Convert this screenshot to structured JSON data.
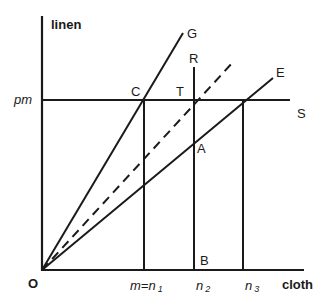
{
  "diagram": {
    "axes": {
      "y_label": "linen",
      "x_label": "cloth",
      "origin_label": "O",
      "price_level_label": "pm"
    },
    "rays": [
      {
        "id": "G",
        "label": "G",
        "style": "solid"
      },
      {
        "id": "dashed",
        "label": "",
        "style": "dashed"
      },
      {
        "id": "E",
        "label": "E",
        "style": "solid"
      }
    ],
    "points": {
      "C": "C",
      "T": "T",
      "A": "A",
      "B": "B",
      "R": "R",
      "S": "S"
    },
    "x_ticks": {
      "n1_prefix": "m=",
      "n1": "n",
      "n1_sub": "1",
      "n2": "n",
      "n2_sub": "2",
      "n3": "n",
      "n3_sub": "3"
    },
    "colors": {
      "line": "#1a1a1a",
      "background": "#ffffff"
    }
  }
}
